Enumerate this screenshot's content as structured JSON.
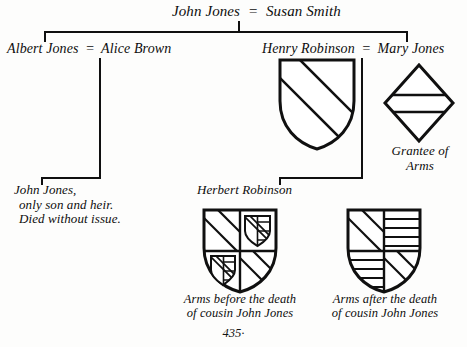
{
  "page": {
    "number": "435·",
    "domain_note": "heraldic pedigree chart"
  },
  "generations": {
    "g1": {
      "husband": "John Jones",
      "marriage_mark": "=",
      "wife": "Susan Smith"
    },
    "g2_left": {
      "husband": "Albert Jones",
      "marriage_mark": "=",
      "wife": "Alice Brown"
    },
    "g2_right": {
      "husband": "Henry Robinson",
      "marriage_mark": "=",
      "wife": "Mary Jones"
    },
    "g3_left": {
      "line1": "John Jones,",
      "line2": "only son and heir.",
      "line3": "Died without issue."
    },
    "g3_right": {
      "name": "Herbert Robinson"
    }
  },
  "arms": {
    "henry_robinson_shield": {
      "label": "",
      "blazon": "a bend",
      "name": "henry-robinson-arms"
    },
    "mary_jones_lozenge": {
      "label_line1": "Grantee of",
      "label_line2": "Arms",
      "blazon": "a fess",
      "name": "mary-jones-lozenge"
    },
    "herbert_before": {
      "caption_line1": "Arms before the death",
      "caption_line2": "of cousin John Jones",
      "blazon": "quarterly 1 and 4 a bend, 2 and 3 an escutcheon charged with a bend and bars"
    },
    "herbert_after": {
      "caption_line1": "Arms after the death",
      "caption_line2": "of cousin John Jones",
      "blazon": "quarterly 1 and 4 a bend, 2 and 3 barry"
    }
  },
  "colors": {
    "ink": "#101010",
    "paper": "#fdfdfc"
  }
}
